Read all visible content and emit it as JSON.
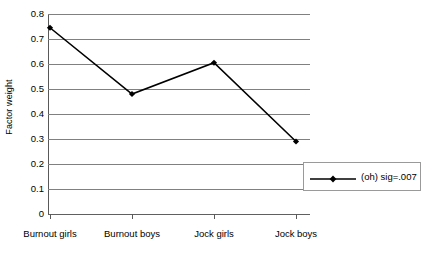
{
  "chart_data": {
    "type": "line",
    "title": "",
    "subtitle": "",
    "xlabel": "",
    "ylabel": "Factor weight",
    "categories": [
      "Burnout girls",
      "Burnout boys",
      "Jock girls",
      "Jock boys"
    ],
    "series": [
      {
        "name": "(oh) sig=.007",
        "values": [
          0.745,
          0.48,
          0.605,
          0.29
        ]
      }
    ],
    "ylim": [
      0,
      0.8
    ],
    "ytick_labels": [
      "0.8",
      "0.7",
      "0.6",
      "0.5",
      "0.4",
      "0.3",
      "0.2",
      "0.1",
      "0"
    ],
    "ytick_values": [
      0.8,
      0.7,
      0.6,
      0.5,
      0.4,
      0.3,
      0.2,
      0.1,
      0
    ],
    "grid": true,
    "grid_axis": "y",
    "legend_position": "right-inside",
    "marker": "diamond",
    "line_color": "#000000",
    "grid_color": "#808080",
    "axis_color": "#595959",
    "background_color": "#ffffff"
  },
  "legend": {
    "entries": [
      {
        "label": "(oh) sig=.007",
        "marker": "diamond-marker",
        "color": "#000000"
      }
    ]
  }
}
